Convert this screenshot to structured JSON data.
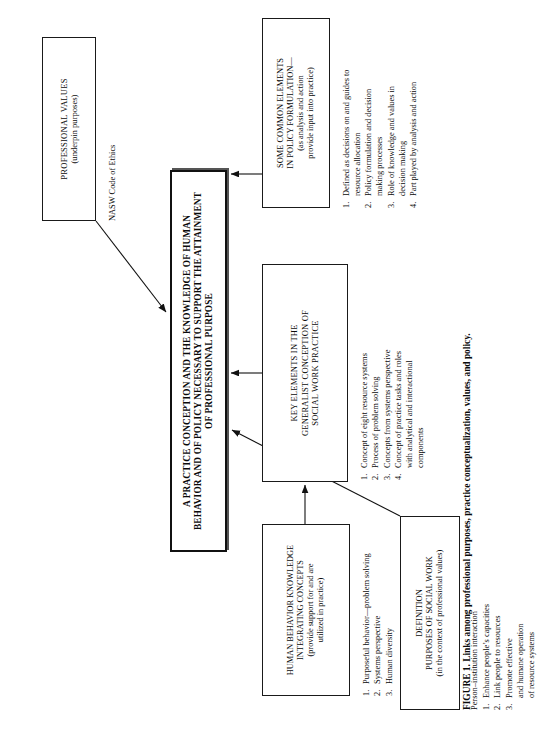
{
  "figure": {
    "caption": "FIGURE 1. Links among professional purposes, practice conceptualization, values, and policy."
  },
  "central": {
    "line1": "A PRACTICE CONCEPTION AND THE KNOWLEDGE OF HUMAN",
    "line2": "BEHAVIOR AND OF POLICY NECESSARY TO SUPPORT THE ATTAINMENT",
    "line3": "OF PROFESSIONAL PURPOSE"
  },
  "values_box": {
    "line1": "PROFESSIONAL VALUES",
    "line2": "(underpin purposes)"
  },
  "values_annotation": "NASW Code of Ethics",
  "definition_box": {
    "line1": "DEFINITION",
    "line2": "PURPOSES OF SOCIAL WORK",
    "line3": "(in the context of professional values)"
  },
  "definition_annotation": "Person–institution interaction",
  "definition_list": [
    {
      "num": "1.",
      "text": "Enhance people’s capacities"
    },
    {
      "num": "2.",
      "text": "Link people to resources"
    },
    {
      "num": "3.",
      "text": "Promote effective\nand humane operation\nof resource systems"
    }
  ],
  "policy_box": {
    "line1": "SOME COMMON ELEMENTS",
    "line2": "IN POLICY FORMULATION—",
    "line3": "(as analysis and action",
    "line4": "provide input into practice)"
  },
  "policy_list": [
    {
      "num": "1.",
      "text": "Defined as decisions on and guides to\nresource allocation"
    },
    {
      "num": "2.",
      "text": "Policy formulation and decision\nmaking processes"
    },
    {
      "num": "3.",
      "text": "Role of knowledge and values in\ndecision making"
    },
    {
      "num": "4.",
      "text": "Part played by analysis and action"
    }
  ],
  "key_elements_box": {
    "line1": "KEY ELEMENTS IN THE",
    "line2": "GENERALIST CONCEPTION OF",
    "line3": "SOCIAL WORK PRACTICE"
  },
  "key_elements_list": [
    {
      "num": "1.",
      "text": "Concept of eight resource systems"
    },
    {
      "num": "2.",
      "text": "Process of problem solving"
    },
    {
      "num": "3.",
      "text": "Concepts from systems perspective"
    },
    {
      "num": "4.",
      "text": "Concept of practice tasks and roles\nwith analytical and interactional\ncomponents"
    }
  ],
  "human_behavior_box": {
    "line1": "HUMAN BEHAVIOR KNOWLEDGE",
    "line2": "INTEGRATING CONCEPTS",
    "line3": "(provide support for and are",
    "line4": "utilized in practice)"
  },
  "human_behavior_list": [
    {
      "num": "1.",
      "text": "Purposeful behavior—problem solving"
    },
    {
      "num": "2.",
      "text": "Systems perspective"
    },
    {
      "num": "3.",
      "text": "Human diversity"
    }
  ],
  "connectors": {
    "values_to_central": "arrow-diagonal-down-left",
    "definition_to_central": "arrow-diagonal-up-right",
    "policy_to_central": "arrow-up",
    "key_elements_to_central": "arrow-up",
    "human_behavior_to_key_elements": "arrow-right"
  },
  "colors": {
    "ink": "#0a0a0a",
    "box_border": "#1a1a1a",
    "emphasis_border": "#111111",
    "background": "#ffffff"
  }
}
